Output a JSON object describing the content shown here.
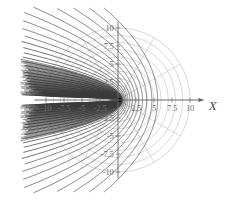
{
  "figure": {
    "kind": "polar-plot",
    "background_color": "#ffffff",
    "axis_color": "#6b6b6b",
    "grid_color": "#b9b9b9",
    "curve_color": "#3a3a3a",
    "tick_label_color": "#6e6e6e",
    "x_axis_label": "X"
  },
  "chart_data": {
    "type": "line",
    "title": "",
    "subtitle": "",
    "xlabel": "X",
    "ylabel": "",
    "xlim": [
      -11.5,
      11.5
    ],
    "ylim": [
      -11,
      11
    ],
    "grid": true,
    "grid_style": "polar",
    "legend": "none",
    "xticks": [
      -10,
      -7.5,
      -5,
      -2.5,
      2.5,
      5,
      7.5,
      10
    ],
    "xtick_labels": [
      "-10",
      "-7.5",
      "-5",
      "-2.5",
      "2.5",
      "5",
      "7.5",
      "10"
    ],
    "yticks": [
      10,
      7.5,
      5,
      2.5,
      -2.5,
      -5,
      -7.5,
      -10
    ],
    "ytick_labels": [
      "10",
      "7.5",
      "5",
      "2.5",
      "-2.5",
      "-5",
      "-7.5",
      "-10"
    ],
    "polar_grid": {
      "radial_circles": [
        1,
        2,
        3,
        4,
        5,
        6,
        7,
        8,
        9,
        10
      ],
      "radial_circle_count": 10,
      "angular_spokes_deg": [
        0,
        30,
        60,
        90,
        120,
        150,
        180,
        210,
        240,
        270,
        300,
        330
      ],
      "angular_spoke_count": 12,
      "max_radius": 10
    },
    "series": [
      {
        "name": "confocal parabolas",
        "family": "r = l / (1 + cos(theta))",
        "description": "Family of left-opening confocal parabolas sharing a focus at the origin; semi-latus-rectum values increase outward.",
        "semi_latus_rectum_values": [
          0.02,
          0.05,
          0.09,
          0.14,
          0.2,
          0.27,
          0.35,
          0.45,
          0.56,
          0.7,
          0.86,
          1.05,
          1.28,
          1.55,
          1.88,
          2.28,
          2.75,
          3.3,
          4.0,
          4.8,
          5.7,
          6.8,
          8.0,
          9.4,
          11.0
        ],
        "point_count": 25
      }
    ],
    "annotations": [
      {
        "text": "X",
        "x": 11.3,
        "y": 0,
        "style": "italic"
      }
    ]
  }
}
